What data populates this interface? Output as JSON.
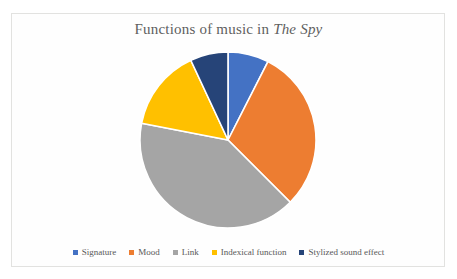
{
  "chart_data": {
    "type": "pie",
    "title": "Functions of music in The Spy",
    "title_prefix": "Functions of music in ",
    "title_italic": "The Spy",
    "xlabel": "",
    "ylabel": "",
    "grid": false,
    "legend_position": "bottom",
    "categories": [
      "Signature",
      "Mood",
      "Link",
      "Indexical function",
      "Stylized sound effect"
    ],
    "values": [
      7.5,
      30,
      40.5,
      15,
      7
    ],
    "colors": [
      "#4472C4",
      "#ED7D31",
      "#A5A5A5",
      "#FFC000",
      "#264478"
    ],
    "start_angle_deg": 0,
    "direction": "clockwise",
    "slice_border_color": "#ffffff",
    "slices": [
      {
        "label": "Signature",
        "value": 7.5,
        "color": "#4472C4",
        "start_deg": 0,
        "end_deg": 27
      },
      {
        "label": "Mood",
        "value": 30,
        "color": "#ED7D31",
        "start_deg": 27,
        "end_deg": 135
      },
      {
        "label": "Link",
        "value": 40.5,
        "color": "#A5A5A5",
        "start_deg": 135,
        "end_deg": 281
      },
      {
        "label": "Indexical function",
        "value": 15,
        "color": "#FFC000",
        "start_deg": 281,
        "end_deg": 335
      },
      {
        "label": "Stylized sound effect",
        "value": 7,
        "color": "#264478",
        "start_deg": 335,
        "end_deg": 360
      }
    ]
  },
  "legend": {
    "items": [
      {
        "label": "Signature",
        "color": "#4472C4"
      },
      {
        "label": "Mood",
        "color": "#ED7D31"
      },
      {
        "label": "Link",
        "color": "#A5A5A5"
      },
      {
        "label": "Indexical function",
        "color": "#FFC000"
      },
      {
        "label": "Stylized sound effect",
        "color": "#264478"
      }
    ]
  }
}
